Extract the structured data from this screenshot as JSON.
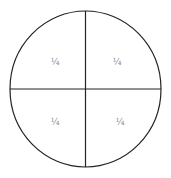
{
  "diagram": {
    "type": "circle-divided-into-quarters",
    "stroke_color": "#222222",
    "label_color": "#8a8a8a",
    "quadrants": [
      {
        "position": "top-left",
        "label": "¼"
      },
      {
        "position": "top-right",
        "label": "¼"
      },
      {
        "position": "bottom-left",
        "label": "¼"
      },
      {
        "position": "bottom-right",
        "label": "¼"
      }
    ]
  }
}
